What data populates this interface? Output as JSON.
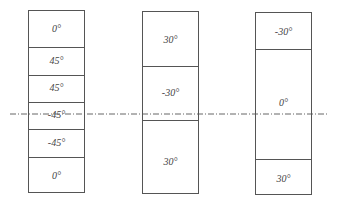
{
  "diagram": {
    "type": "laminate-stacking-sequences",
    "midplane_line": "dash-dot",
    "laminates": [
      {
        "name": "laminate-1",
        "plies": [
          "0°",
          "45°",
          "45°",
          "-45°",
          "-45°",
          "0°"
        ]
      },
      {
        "name": "laminate-2",
        "plies": [
          "30°",
          "-30°",
          "30°"
        ]
      },
      {
        "name": "laminate-3",
        "plies": [
          "-30°",
          "0°",
          "30°"
        ]
      }
    ]
  }
}
